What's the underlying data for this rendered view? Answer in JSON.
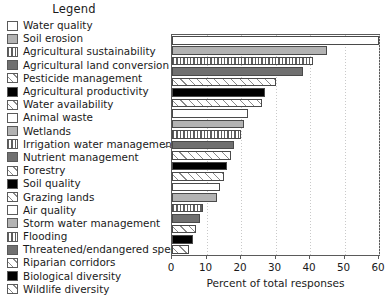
{
  "legend": {
    "title": "Legend",
    "items": [
      {
        "label": "Water quality",
        "pattern": "p-white"
      },
      {
        "label": "Soil erosion",
        "pattern": "p-gray"
      },
      {
        "label": "Agricultural sustainability",
        "pattern": "p-vline"
      },
      {
        "label": "Agricultural land conversion",
        "pattern": "p-dgray"
      },
      {
        "label": "Pesticide management",
        "pattern": "p-hatch"
      },
      {
        "label": "Agricultural productivity",
        "pattern": "p-black"
      },
      {
        "label": "Water availability",
        "pattern": "p-hatch"
      },
      {
        "label": "Animal waste",
        "pattern": "p-white"
      },
      {
        "label": "Wetlands",
        "pattern": "p-gray"
      },
      {
        "label": "Irrigation water management",
        "pattern": "p-vline"
      },
      {
        "label": "Nutrient management",
        "pattern": "p-dgray"
      },
      {
        "label": "Forestry",
        "pattern": "p-hatch"
      },
      {
        "label": "Soil quality",
        "pattern": "p-black"
      },
      {
        "label": "Grazing lands",
        "pattern": "p-hatch"
      },
      {
        "label": "Air quality",
        "pattern": "p-white"
      },
      {
        "label": "Storm water management",
        "pattern": "p-gray"
      },
      {
        "label": "Flooding",
        "pattern": "p-vline"
      },
      {
        "label": "Threatened/endangered species",
        "pattern": "p-dgray"
      },
      {
        "label": "Riparian corridors",
        "pattern": "p-hatch"
      },
      {
        "label": "Biological diversity",
        "pattern": "p-black"
      },
      {
        "label": "Wildlife diversity",
        "pattern": "p-hatch"
      }
    ]
  },
  "chart_data": {
    "type": "bar",
    "orientation": "horizontal",
    "title": "",
    "xlabel": "Percent of total responses",
    "ylabel": "",
    "xlim": [
      0,
      60
    ],
    "xticks": [
      0,
      10,
      20,
      30,
      40,
      50,
      60
    ],
    "xtick_labels": [
      "0",
      "10",
      "20",
      "30",
      "40",
      "50",
      "60"
    ],
    "grid": "vertical-dotted",
    "legend_position": "left-outside",
    "categories": [
      "Water quality",
      "Soil erosion",
      "Agricultural sustainability",
      "Agricultural land conversion",
      "Pesticide management",
      "Agricultural productivity",
      "Water availability",
      "Animal waste",
      "Wetlands",
      "Irrigation water management",
      "Nutrient management",
      "Forestry",
      "Soil quality",
      "Grazing lands",
      "Air quality",
      "Storm water management",
      "Flooding",
      "Threatened/endangered species"
    ],
    "values": [
      60,
      45,
      41,
      38,
      30,
      27,
      26,
      22,
      21,
      20,
      18,
      17,
      16,
      15,
      14,
      13,
      9,
      8
    ],
    "bars": [
      {
        "label": "Water quality",
        "value": 60,
        "pattern": "p-white"
      },
      {
        "label": "Soil erosion",
        "value": 45,
        "pattern": "p-gray"
      },
      {
        "label": "Agricultural sustainability",
        "value": 41,
        "pattern": "p-vline"
      },
      {
        "label": "Agricultural land conversion",
        "value": 38,
        "pattern": "p-dgray"
      },
      {
        "label": "Pesticide management",
        "value": 30,
        "pattern": "p-hatch"
      },
      {
        "label": "Agricultural productivity",
        "value": 27,
        "pattern": "p-black"
      },
      {
        "label": "Water availability",
        "value": 26,
        "pattern": "p-hatch"
      },
      {
        "label": "Animal waste",
        "value": 22,
        "pattern": "p-white"
      },
      {
        "label": "Wetlands",
        "value": 21,
        "pattern": "p-gray"
      },
      {
        "label": "Irrigation water management",
        "value": 20,
        "pattern": "p-vline"
      },
      {
        "label": "Nutrient management",
        "value": 18,
        "pattern": "p-dgray"
      },
      {
        "label": "Forestry",
        "value": 17,
        "pattern": "p-hatch"
      },
      {
        "label": "Soil quality",
        "value": 16,
        "pattern": "p-black"
      },
      {
        "label": "Grazing lands",
        "value": 15,
        "pattern": "p-hatch"
      },
      {
        "label": "Air quality",
        "value": 14,
        "pattern": "p-white"
      },
      {
        "label": "Storm water management",
        "value": 13,
        "pattern": "p-gray"
      },
      {
        "label": "Flooding",
        "value": 9,
        "pattern": "p-vline"
      },
      {
        "label": "Threatened/endangered species",
        "value": 8,
        "pattern": "p-dgray"
      },
      {
        "label": "Riparian corridors",
        "value": 7,
        "pattern": "p-hatch"
      },
      {
        "label": "Biological diversity",
        "value": 6,
        "pattern": "p-black"
      },
      {
        "label": "Wildlife diversity",
        "value": 5,
        "pattern": "p-hatch"
      }
    ]
  }
}
